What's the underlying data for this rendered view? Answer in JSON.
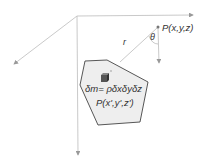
{
  "diagram": {
    "point_label": "P(x,y,z)",
    "angle_label": "θ",
    "distance_label": "r",
    "mass_element_label": "δm= ρδxδyδz",
    "source_point_label": "P(x',y',z')"
  },
  "colors": {
    "axis": "#b0b0b0",
    "body_fill": "#eeeeee",
    "body_stroke": "#444444",
    "text": "#333333",
    "cube": "#555555"
  }
}
